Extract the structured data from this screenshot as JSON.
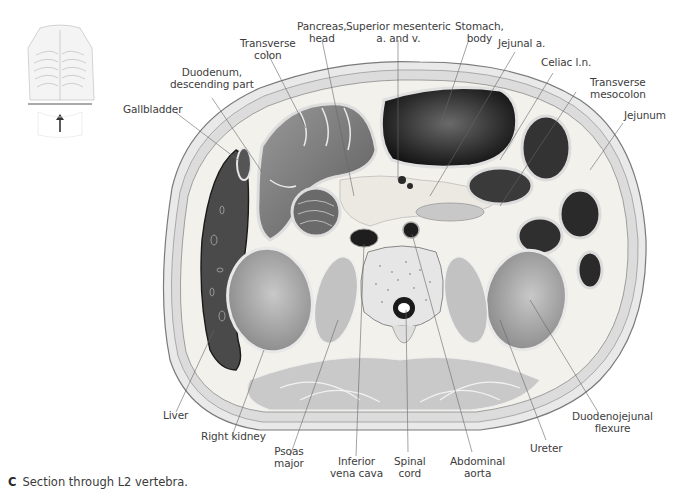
{
  "figure": {
    "caption_letter": "C",
    "caption_text": "Section through L2 vertebra.",
    "orientation_thumbnail": {
      "description": "thorax skeleton with horizontal plane line and upward arrow",
      "arrow_icon": "arrow-up-icon"
    }
  },
  "labels": {
    "transverse_colon": {
      "line1": "Transverse",
      "line2": "colon"
    },
    "pancreas_head": {
      "line1": "Pancreas,",
      "line2": "head"
    },
    "superior_mesenteric": {
      "line1": "Superior mesenteric",
      "line2": "a. and v."
    },
    "stomach_body": {
      "line1": "Stomach,",
      "line2": "body"
    },
    "jejunal_a": {
      "line1": "Jejunal a."
    },
    "celiac_ln": {
      "line1": "Celiac l.n."
    },
    "transverse_mesocolon": {
      "line1": "Transverse",
      "line2": "mesocolon"
    },
    "jejunum": {
      "line1": "Jejunum"
    },
    "duodenum_descending": {
      "line1": "Duodenum,",
      "line2": "descending part"
    },
    "gallbladder": {
      "line1": "Gallbladder"
    },
    "liver": {
      "line1": "Liver"
    },
    "right_kidney": {
      "line1": "Right kidney"
    },
    "psoas_major": {
      "line1": "Psoas",
      "line2": "major"
    },
    "inferior_vena_cava": {
      "line1": "Inferior",
      "line2": "vena cava"
    },
    "spinal_cord": {
      "line1": "Spinal",
      "line2": "cord"
    },
    "abdominal_aorta": {
      "line1": "Abdominal",
      "line2": "aorta"
    },
    "ureter": {
      "line1": "Ureter"
    },
    "duodenojejunal_flexure": {
      "line1": "Duodenojejunal",
      "line2": "flexure"
    }
  }
}
